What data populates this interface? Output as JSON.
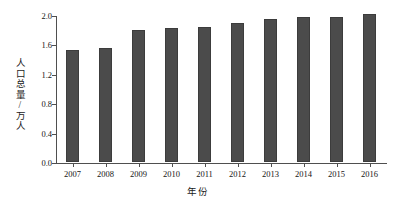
{
  "chart_data": {
    "type": "bar",
    "title": "",
    "xlabel": "年份",
    "ylabel": "人口总量/万人",
    "categories": [
      "2007",
      "2008",
      "2009",
      "2010",
      "2011",
      "2012",
      "2013",
      "2014",
      "2015",
      "2016"
    ],
    "values": [
      1.53,
      1.55,
      1.8,
      1.83,
      1.84,
      1.89,
      1.94,
      1.97,
      1.97,
      2.02
    ],
    "series": [
      {
        "name": "人口总量",
        "values": [
          1.53,
          1.55,
          1.8,
          1.83,
          1.84,
          1.89,
          1.94,
          1.97,
          1.97,
          2.02
        ]
      }
    ],
    "ylim": [
      0.0,
      2.0
    ],
    "yticks": [
      "0.0",
      "0.4",
      "0.8",
      "1.2",
      "1.6",
      "2.0"
    ],
    "ytick_values": [
      0.0,
      0.4,
      0.8,
      1.2,
      1.6,
      2.0
    ],
    "grid": false,
    "legend": null,
    "bar_color": "#4b4b4b",
    "axis_color": "#4f4f4f",
    "background": "#ffffff"
  }
}
